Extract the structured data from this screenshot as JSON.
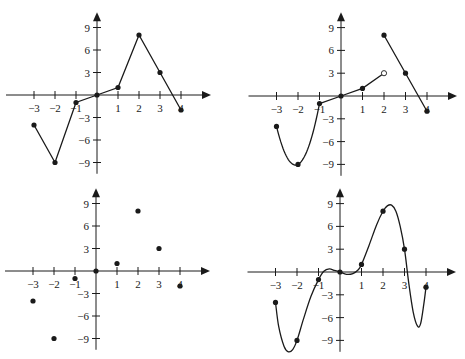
{
  "chart_data": [
    {
      "id": "top-left",
      "type": "line",
      "title": "",
      "xlabel": "",
      "ylabel": "",
      "description": "Piecewise linear connect-the-dots graph",
      "x_ticks": [
        -3,
        -2,
        -1,
        1,
        2,
        3,
        4
      ],
      "x_tick_labels": [
        "−3",
        "−2",
        "−1",
        "1",
        "2",
        "3",
        "4"
      ],
      "y_ticks": [
        9,
        6,
        3,
        -3,
        -6,
        -9
      ],
      "y_tick_labels": [
        "9",
        "6",
        "3",
        "−3",
        "−6",
        "−9"
      ],
      "xlim": [
        -3.5,
        5
      ],
      "ylim": [
        -10.5,
        10.5
      ],
      "grid": false,
      "x": [
        -3,
        -2,
        -1,
        0,
        1,
        2,
        3,
        4
      ],
      "y": [
        -4,
        -9,
        -1,
        0,
        1,
        8,
        3,
        -2
      ],
      "markers": "filled",
      "frame": {
        "ox": 97,
        "oy": 95,
        "sx": 21,
        "sy": 7.5
      }
    },
    {
      "id": "top-right",
      "type": "line",
      "title": "",
      "xlabel": "",
      "ylabel": "",
      "description": "Piecewise function: parabola on [-3,-1], line on [-1,2) with open endpoint, line on [2,4]",
      "x_ticks": [
        -3,
        -2,
        -1,
        1,
        2,
        3,
        4
      ],
      "x_tick_labels": [
        "−3",
        "−2",
        "−1",
        "1",
        "2",
        "3",
        "4"
      ],
      "y_ticks": [
        9,
        6,
        3,
        -3,
        -6,
        -9
      ],
      "y_tick_labels": [
        "9",
        "6",
        "3",
        "−3",
        "−6",
        "−9"
      ],
      "xlim": [
        -3.5,
        5
      ],
      "ylim": [
        -10.5,
        10.5
      ],
      "grid": false,
      "segments": [
        {
          "kind": "parabola",
          "points": [
            [
              -3,
              -4
            ],
            [
              -2,
              -9
            ],
            [
              -1,
              -1
            ]
          ]
        },
        {
          "kind": "linear",
          "points": [
            [
              -1,
              -1
            ],
            [
              0,
              0
            ],
            [
              1,
              1
            ],
            [
              2,
              3
            ]
          ],
          "open_end": true
        },
        {
          "kind": "linear",
          "points": [
            [
              2,
              8
            ],
            [
              3,
              3
            ],
            [
              4,
              -2
            ]
          ]
        }
      ],
      "filled_points": [
        [
          -3,
          -4
        ],
        [
          -2,
          -9
        ],
        [
          -1,
          -1
        ],
        [
          0,
          0
        ],
        [
          1,
          1
        ],
        [
          2,
          8
        ],
        [
          3,
          3
        ],
        [
          4,
          -2
        ]
      ],
      "open_points": [
        [
          2,
          3
        ]
      ],
      "frame": {
        "ox": 341,
        "oy": 96,
        "sx": 21.5,
        "sy": 7.6
      }
    },
    {
      "id": "bottom-left",
      "type": "scatter",
      "title": "",
      "xlabel": "",
      "ylabel": "",
      "description": "Scatter of discrete data points",
      "x_ticks": [
        -3,
        -2,
        -1,
        1,
        2,
        3,
        4
      ],
      "x_tick_labels": [
        "−3",
        "−2",
        "−1",
        "1",
        "2",
        "3",
        "4"
      ],
      "y_ticks": [
        9,
        6,
        3,
        -3,
        -6,
        -9
      ],
      "y_tick_labels": [
        "9",
        "6",
        "3",
        "−3",
        "−6",
        "−9"
      ],
      "xlim": [
        -3.5,
        5
      ],
      "ylim": [
        -10.5,
        10.5
      ],
      "grid": false,
      "x": [
        -3,
        -2,
        -1,
        0,
        1,
        2,
        3,
        4
      ],
      "y": [
        -4,
        -9,
        -1,
        0,
        1,
        8,
        3,
        -2
      ],
      "frame": {
        "ox": 96,
        "oy": 271,
        "sx": 21,
        "sy": 7.5
      }
    },
    {
      "id": "bottom-right",
      "type": "line",
      "title": "",
      "xlabel": "",
      "ylabel": "",
      "description": "Smooth interpolating curve through the data points",
      "x_ticks": [
        -3,
        -2,
        -1,
        1,
        2,
        3,
        4
      ],
      "x_tick_labels": [
        "−3",
        "−2",
        "−1",
        "1",
        "2",
        "3",
        "4"
      ],
      "y_ticks": [
        9,
        6,
        3,
        -3,
        -6,
        -9
      ],
      "y_tick_labels": [
        "9",
        "6",
        "3",
        "−3",
        "−6",
        "−9"
      ],
      "xlim": [
        -3.5,
        5
      ],
      "ylim": [
        -10.5,
        10.5
      ],
      "grid": false,
      "x": [
        -3,
        -2,
        -1,
        0,
        1,
        2,
        3,
        4
      ],
      "y": [
        -4,
        -9,
        -1,
        0,
        1,
        8,
        3,
        -2
      ],
      "curve": [
        [
          -3,
          -4
        ],
        [
          -2.85,
          -7.2
        ],
        [
          -2.6,
          -9.8
        ],
        [
          -2.4,
          -10.5
        ],
        [
          -2.2,
          -10.2
        ],
        [
          -2,
          -9
        ],
        [
          -1.7,
          -6.2
        ],
        [
          -1.35,
          -3.2
        ],
        [
          -1,
          -1
        ],
        [
          -0.75,
          0.1
        ],
        [
          -0.5,
          0.4
        ],
        [
          -0.25,
          0.2
        ],
        [
          0,
          0
        ],
        [
          0.3,
          -0.3
        ],
        [
          0.6,
          -0.2
        ],
        [
          0.85,
          0.3
        ],
        [
          1,
          1
        ],
        [
          1.35,
          3.5
        ],
        [
          1.7,
          6.2
        ],
        [
          2,
          8
        ],
        [
          2.2,
          8.7
        ],
        [
          2.4,
          8.8
        ],
        [
          2.6,
          8.0
        ],
        [
          2.8,
          6.0
        ],
        [
          3,
          3
        ],
        [
          3.2,
          -1.5
        ],
        [
          3.4,
          -5.2
        ],
        [
          3.6,
          -7.1
        ],
        [
          3.75,
          -6.8
        ],
        [
          3.9,
          -4.2
        ],
        [
          4,
          -2
        ]
      ],
      "frame": {
        "ox": 340,
        "oy": 272,
        "sx": 21.5,
        "sy": 7.6
      }
    }
  ]
}
